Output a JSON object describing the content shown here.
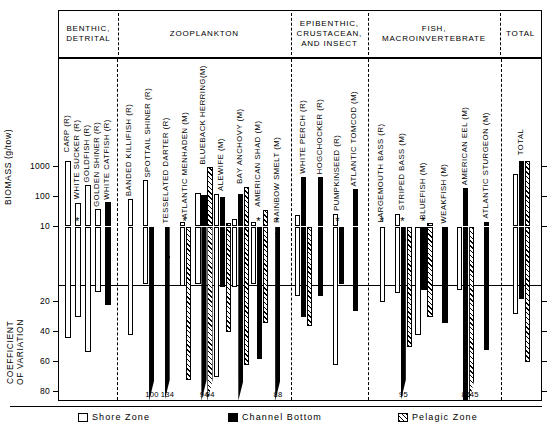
{
  "figure": {
    "axis_top_title": "BIOMASS (g/tow)",
    "axis_bottom_title": "COEFFICIENT\nOF VARIATION",
    "biomass_ticks": [
      "1000",
      "100",
      "10"
    ],
    "cv_ticks": [
      "20",
      "40",
      "60",
      "80"
    ]
  },
  "groups": [
    {
      "label": "BENTHIC,\nDETRITAL"
    },
    {
      "label": "ZOOPLANKTON"
    },
    {
      "label": "EPIBENTHIC,\nCRUSTACEAN,\nAND  INSECT"
    },
    {
      "label": "FISH,\nMACROINVERTEBRATE"
    },
    {
      "label": "TOTAL"
    }
  ],
  "legend": [
    {
      "key": "shore",
      "label": "Shore Zone"
    },
    {
      "key": "channel",
      "label": "Channel Bottom"
    },
    {
      "key": "pelagic",
      "label": "Pelagic Zone"
    }
  ],
  "chart_data": {
    "type": "bar",
    "title": "",
    "ylabel_top": "BIOMASS (g/tow)",
    "ylabel_bottom": "COEFFICIENT OF VARIATION",
    "top_axis_scale": "log",
    "top_axis_ticks": [
      1000,
      100,
      10
    ],
    "bottom_axis_ticks": [
      20,
      40,
      60,
      80
    ],
    "bottom_axis_inverted": true,
    "grid": false,
    "legend_position": "bottom",
    "series": [
      {
        "name": "Shore Zone",
        "key": "shore"
      },
      {
        "name": "Channel Bottom",
        "key": "channel"
      },
      {
        "name": "Pelagic Zone",
        "key": "pelagic"
      }
    ],
    "categories": [
      "CARP (R)",
      "WHITE SUCKER (R)",
      "GOLDFISH (R)",
      "GOLDEN SHINER (R)",
      "WHITE CATFISH (R)",
      "BANDED KILLIFISH (R)",
      "SPOTTAIL SHINER (R)",
      "TESSELATED DARTER (R)",
      "ATLANTIC MENHADEN (M)",
      "BLUEBACK HERRING(M)",
      "ALEWIFE (M)",
      "BAY ANCHOVY (M)",
      "AMERICAN SHAD (M)",
      "RAINBOW SMELT (M)",
      "WHITE PERCH (R)",
      "HOGCHOCKER (R)",
      "PUMPKINSEED (R)",
      "ATLANTIC TOMCOD (M)",
      "LARGEMOUTH BASS (R)",
      "STRIPED BASS (M)",
      "BLUEFISH (M)",
      "WEAKFISH (M)",
      "AMERICAN EEL (M)",
      "ATLANTIC STURGEON (M)",
      "TOTAL"
    ],
    "biomass": {
      "CARP (R)": {
        "shore": 2200,
        "channel": null,
        "pelagic": null
      },
      "WHITE SUCKER (R)": {
        "shore": 60,
        "channel": null,
        "pelagic": null
      },
      "GOLDFISH (R)": {
        "shore": 230,
        "channel": null,
        "pelagic": null
      },
      "GOLDEN SHINER (R)": {
        "shore": 36,
        "channel": null,
        "pelagic": null
      },
      "WHITE CATFISH (R)": {
        "shore": null,
        "channel": 62,
        "pelagic": null
      },
      "BANDED KILLIFISH (R)": {
        "shore": 82,
        "channel": null,
        "pelagic": null
      },
      "SPOTTAIL SHINER (R)": {
        "shore": 330,
        "channel": 2.6,
        "pelagic": null
      },
      "TESSELATED DARTER (R)": {
        "shore": null,
        "channel": 1.0,
        "pelagic": null
      },
      "ATLANTIC MENHADEN (M)": {
        "shore": 14,
        "channel": null,
        "pelagic": 2.1
      },
      "BLUEBACK HERRING(M)": {
        "shore": 130,
        "channel": 110,
        "pelagic": 900
      },
      "ALEWIFE (M)": {
        "shore": 120,
        "channel": 90,
        "pelagic": 13
      },
      "BAY ANCHOVY (M)": {
        "shore": 17,
        "channel": 120,
        "pelagic": 200
      },
      "AMERICAN SHAD (M)": {
        "shore": 14,
        "channel": 5.0,
        "pelagic": 34
      },
      "RAINBOW SMELT (M)": {
        "shore": null,
        "channel": 6.0,
        "pelagic": null
      },
      "WHITE PERCH (R)": {
        "shore": 24,
        "channel": 430,
        "pelagic": 2.0
      },
      "HOGCHOCKER (R)": {
        "shore": null,
        "channel": 420,
        "pelagic": null
      },
      "PUMPKINSEED (R)": {
        "shore": 26,
        "channel": 0.55,
        "pelagic": null
      },
      "ATLANTIC TOMCOD (M)": {
        "shore": null,
        "channel": 170,
        "pelagic": null
      },
      "LARGEMOUTH BASS (R)": {
        "shore": 5.5,
        "channel": null,
        "pelagic": null
      },
      "STRIPED BASS (M)": {
        "shore": 26,
        "channel": 3.6,
        "pelagic": 4.4
      },
      "BLUEFISH (M)": {
        "shore": 4.2,
        "channel": 3.2,
        "pelagic": 13
      },
      "WEAKFISH (M)": {
        "shore": null,
        "channel": 1.5,
        "pelagic": null
      },
      "AMERICAN EEL (M)": {
        "shore": 3.0,
        "channel": 180,
        "pelagic": 0.62
      },
      "ATLANTIC STURGEON (M)": {
        "shore": null,
        "channel": 14,
        "pelagic": null
      },
      "TOTAL": {
        "shore": 560,
        "channel": 1500,
        "pelagic": 1800
      }
    },
    "coefficient_of_variation": {
      "CARP (R)": {
        "shore": 44,
        "channel": null,
        "pelagic": null
      },
      "WHITE SUCKER (R)": {
        "shore": 30,
        "channel": null,
        "pelagic": null
      },
      "GOLDFISH (R)": {
        "shore": 53,
        "channel": null,
        "pelagic": null
      },
      "GOLDEN SHINER (R)": {
        "shore": 13,
        "channel": null,
        "pelagic": null
      },
      "WHITE CATFISH (R)": {
        "shore": null,
        "channel": 22,
        "pelagic": null
      },
      "BANDED KILLIFISH (R)": {
        "shore": 42,
        "channel": null,
        "pelagic": null
      },
      "SPOTTAIL SHINER (R)": {
        "shore": 8,
        "channel": 100,
        "pelagic": null
      },
      "TESSELATED DARTER (R)": {
        "shore": null,
        "channel": 134,
        "pelagic": null
      },
      "ATLANTIC MENHADEN (M)": {
        "shore": 9,
        "channel": null,
        "pelagic": 72
      },
      "BLUEBACK HERRING(M)": {
        "shore": 8,
        "channel": 94,
        "pelagic": 94
      },
      "ALEWIFE (M)": {
        "shore": 70,
        "channel": 10,
        "pelagic": 40
      },
      "BAY ANCHOVY (M)": {
        "shore": 10,
        "channel": 88,
        "pelagic": 62
      },
      "AMERICAN SHAD (M)": {
        "shore": 8,
        "channel": 58,
        "pelagic": 34
      },
      "RAINBOW SMELT (M)": {
        "shore": null,
        "channel": 88,
        "pelagic": null
      },
      "WHITE PERCH (R)": {
        "shore": 16,
        "channel": 30,
        "pelagic": 36
      },
      "HOGCHOCKER (R)": {
        "shore": null,
        "channel": 16,
        "pelagic": null
      },
      "PUMPKINSEED (R)": {
        "shore": 62,
        "channel": 8,
        "pelagic": null
      },
      "ATLANTIC TOMCOD (M)": {
        "shore": null,
        "channel": 26,
        "pelagic": null
      },
      "LARGEMOUTH BASS (R)": {
        "shore": 20,
        "channel": null,
        "pelagic": null
      },
      "STRIPED BASS (M)": {
        "shore": 14,
        "channel": 95,
        "pelagic": 50
      },
      "BLUEFISH (M)": {
        "shore": 42,
        "channel": 12,
        "pelagic": 30
      },
      "WEAKFISH (M)": {
        "shore": null,
        "channel": 34,
        "pelagic": null
      },
      "AMERICAN EEL (M)": {
        "shore": 12,
        "channel": 85,
        "pelagic": 145
      },
      "ATLANTIC STURGEON (M)": {
        "shore": null,
        "channel": 52,
        "pelagic": null
      },
      "TOTAL": {
        "shore": 28,
        "channel": 18,
        "pelagic": 60
      }
    },
    "overflow_labels": [
      {
        "value": "100",
        "category": "SPOTTAIL SHINER (R)",
        "series": "channel"
      },
      {
        "value": "134",
        "category": "TESSELATED DARTER (R)",
        "series": "channel"
      },
      {
        "value": "94",
        "category": "BLUEBACK HERRING(M)",
        "series": "channel"
      },
      {
        "value": "94",
        "category": "BLUEBACK HERRING(M)",
        "series": "pelagic"
      },
      {
        "value": "88",
        "category": "RAINBOW SMELT (M)",
        "series": "channel"
      },
      {
        "value": "95",
        "category": "STRIPED BASS (M)",
        "series": "channel"
      },
      {
        "value": "85",
        "category": "AMERICAN EEL (M)",
        "series": "channel"
      },
      {
        "value": "145",
        "category": "AMERICAN EEL (M)",
        "series": "pelagic"
      }
    ],
    "asterisk_markers": [
      "WHITE SUCKER (R)",
      "ATLANTIC MENHADEN (M)",
      "AMERICAN SHAD (M)",
      "RAINBOW SMELT (M)",
      "PUMPKINSEED (R)",
      "LARGEMOUTH BASS (R)",
      "STRIPED BASS (M)",
      "BLUEFISH (M)",
      "AMERICAN EEL (M)"
    ]
  }
}
